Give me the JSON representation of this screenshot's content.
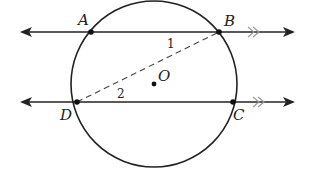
{
  "diagram": {
    "type": "circle with two parallel secant lines",
    "circle": {
      "center_label": "O"
    },
    "points": {
      "A": {
        "label": "A"
      },
      "B": {
        "label": "B"
      },
      "C": {
        "label": "C"
      },
      "D": {
        "label": "D"
      },
      "O": {
        "label": "O"
      }
    },
    "angles": {
      "angle1": {
        "label": "1"
      },
      "angle2": {
        "label": "2"
      }
    },
    "lines": [
      {
        "name": "line AB",
        "through": [
          "A",
          "B"
        ],
        "parallel_mark": ">>"
      },
      {
        "name": "line DC",
        "through": [
          "D",
          "C"
        ],
        "parallel_mark": ">>"
      }
    ],
    "segments": [
      {
        "name": "segment DB",
        "style": "dashed"
      }
    ],
    "colors": {
      "stroke": "#222222",
      "parallel_mark": "#999999"
    }
  }
}
